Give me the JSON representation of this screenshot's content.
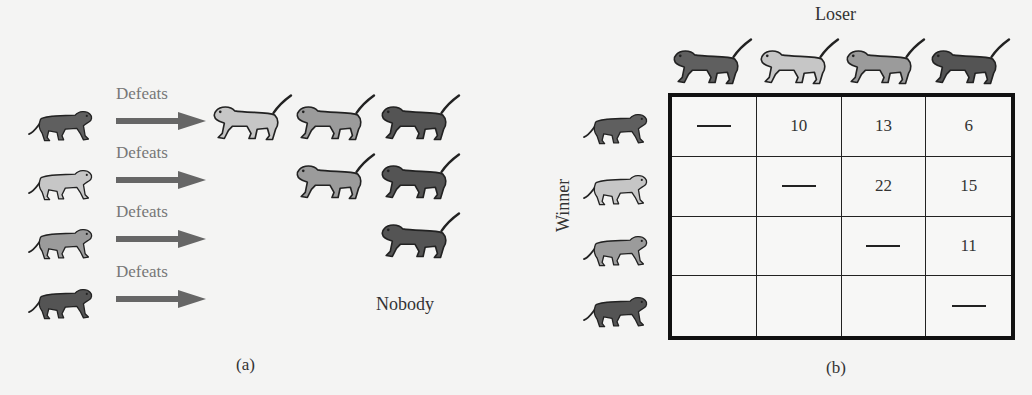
{
  "monkey_shades": {
    "A": "#5f5f5f",
    "B": "#c6c6c6",
    "C": "#9b9b9b",
    "D": "#545454"
  },
  "outline_color": "#222222",
  "arrow_color": "#666666",
  "panel_a": {
    "caption": "(a)",
    "rows": [
      {
        "winner": "A",
        "label": "Defeats",
        "losers": [
          "B",
          "C",
          "D"
        ],
        "note": ""
      },
      {
        "winner": "B",
        "label": "Defeats",
        "losers": [
          "C",
          "D"
        ],
        "note": ""
      },
      {
        "winner": "C",
        "label": "Defeats",
        "losers": [
          "D"
        ],
        "note": ""
      },
      {
        "winner": "D",
        "label": "Defeats",
        "losers": [],
        "note": "Nobody"
      }
    ]
  },
  "panel_b": {
    "caption": "(b)",
    "column_title": "Loser",
    "row_title": "Winner",
    "columns": [
      "A",
      "B",
      "C",
      "D"
    ],
    "rows": [
      "A",
      "B",
      "C",
      "D"
    ],
    "cells": [
      [
        "—",
        "10",
        "13",
        "6"
      ],
      [
        "",
        "—",
        "22",
        "15"
      ],
      [
        "",
        "",
        "—",
        "11"
      ],
      [
        "",
        "",
        "",
        "—"
      ]
    ]
  }
}
